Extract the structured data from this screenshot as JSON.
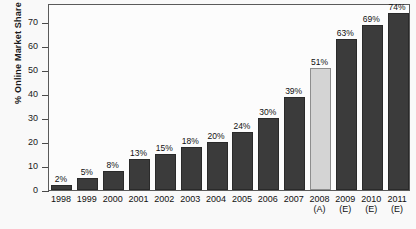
{
  "chart_data": {
    "type": "bar",
    "title": "",
    "xlabel": "",
    "ylabel": "% Online Market Share",
    "ylim": [
      0,
      78
    ],
    "yticks": [
      0,
      10,
      20,
      30,
      40,
      50,
      60,
      70
    ],
    "grid": false,
    "legend": null,
    "categories": [
      "1998",
      "1999",
      "2000",
      "2001",
      "2002",
      "2003",
      "2004",
      "2005",
      "2006",
      "2007",
      "2008",
      "2009",
      "2010",
      "2011"
    ],
    "category_sublabels": [
      "",
      "",
      "",
      "",
      "",
      "",
      "",
      "",
      "",
      "",
      "(A)",
      "(E)",
      "(E)",
      "(E)"
    ],
    "values": [
      2,
      5,
      8,
      13,
      15,
      18,
      20,
      24,
      30,
      39,
      51,
      63,
      69,
      74
    ],
    "data_labels": [
      "2%",
      "5%",
      "8%",
      "13%",
      "15%",
      "18%",
      "20%",
      "24%",
      "30%",
      "39%",
      "51%",
      "63%",
      "69%",
      "74%"
    ],
    "bar_styles": [
      "dark",
      "dark",
      "dark",
      "dark",
      "dark",
      "dark",
      "dark",
      "dark",
      "dark",
      "dark",
      "light",
      "dark",
      "dark",
      "dark"
    ]
  },
  "colors": {
    "bar_dark": "#3b3b3b",
    "bar_light": "#d4d4d4",
    "bar_light_border": "#8d8d8d",
    "axis": "#5a5a5a",
    "text": "#111111",
    "background": "#f9f9f9",
    "plot_background": "#fcfcfc"
  }
}
